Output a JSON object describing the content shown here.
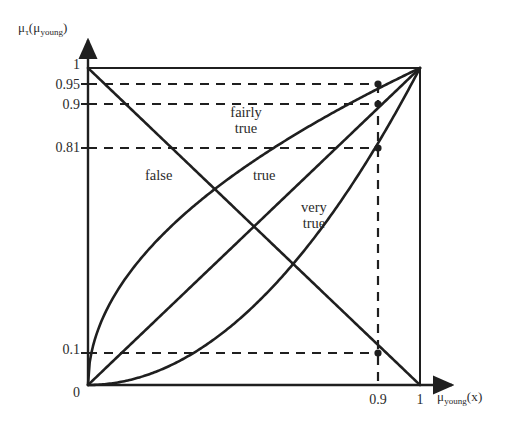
{
  "chart_data": {
    "type": "line",
    "title": "",
    "xlabel": "μ_young(x)",
    "ylabel": "μ_τ(μ_young)",
    "xlim": [
      0,
      1
    ],
    "ylim": [
      0,
      1
    ],
    "grid": false,
    "legend_position": "inline-annotations",
    "x_ticks": [
      "0",
      "0.9",
      "1"
    ],
    "x_tick_values": [
      0,
      0.9,
      1
    ],
    "y_ticks": [
      "0",
      "0.1",
      "0.81",
      "0.9",
      "0.95",
      "1"
    ],
    "y_tick_values": [
      0,
      0.1,
      0.81,
      0.9,
      0.95,
      1
    ],
    "series": [
      {
        "name": "false",
        "formula": "1 - x",
        "x": [
          0,
          0.1,
          0.2,
          0.3,
          0.4,
          0.5,
          0.6,
          0.7,
          0.8,
          0.9,
          1
        ],
        "values": [
          1,
          0.9,
          0.8,
          0.7,
          0.6,
          0.5,
          0.4,
          0.3,
          0.2,
          0.1,
          0
        ]
      },
      {
        "name": "true",
        "formula": "x",
        "x": [
          0,
          0.1,
          0.2,
          0.3,
          0.4,
          0.5,
          0.6,
          0.7,
          0.8,
          0.9,
          1
        ],
        "values": [
          0,
          0.1,
          0.2,
          0.3,
          0.4,
          0.5,
          0.6,
          0.7,
          0.8,
          0.9,
          1
        ]
      },
      {
        "name": "fairly true",
        "formula": "sqrt(x)",
        "x": [
          0,
          0.1,
          0.2,
          0.3,
          0.4,
          0.5,
          0.6,
          0.7,
          0.8,
          0.9,
          1
        ],
        "values": [
          0,
          0.316,
          0.447,
          0.548,
          0.632,
          0.707,
          0.775,
          0.837,
          0.894,
          0.95,
          1
        ]
      },
      {
        "name": "very true",
        "formula": "x^2",
        "x": [
          0,
          0.1,
          0.2,
          0.3,
          0.4,
          0.5,
          0.6,
          0.7,
          0.8,
          0.9,
          1
        ],
        "values": [
          0,
          0.01,
          0.04,
          0.09,
          0.16,
          0.25,
          0.36,
          0.49,
          0.64,
          0.81,
          1
        ]
      }
    ],
    "annotations": [
      {
        "label": "false",
        "x": 0.21,
        "y": 0.655
      },
      {
        "label": "true",
        "x": 0.52,
        "y": 0.655
      },
      {
        "label": "fairly true",
        "x": 0.435,
        "y": 0.84
      },
      {
        "label": "very true",
        "x": 0.645,
        "y": 0.53
      }
    ],
    "reference_lines": [
      {
        "axis": "y",
        "value": 0.95,
        "style": "dashed",
        "marks_series": "fairly true"
      },
      {
        "axis": "y",
        "value": 0.9,
        "style": "dashed",
        "marks_series": "true"
      },
      {
        "axis": "y",
        "value": 0.81,
        "style": "dashed",
        "marks_series": "very true"
      },
      {
        "axis": "y",
        "value": 0.1,
        "style": "dashed",
        "marks_series": "false"
      },
      {
        "axis": "x",
        "value": 0.9,
        "style": "dashed"
      }
    ],
    "markers_at_x_0_9": [
      {
        "series": "fairly true",
        "y": 0.95
      },
      {
        "series": "true",
        "y": 0.9
      },
      {
        "series": "very true",
        "y": 0.81
      },
      {
        "series": "false",
        "y": 0.1
      }
    ],
    "colors": {
      "curve": "#1f1f1f",
      "dashed": "#1f1f1f",
      "axis": "#1f1f1f",
      "text": "#2b2b2b",
      "background": "#ffffff"
    }
  },
  "axes": {
    "y_axis_label_mu": "μ",
    "y_axis_label_tau_sub": "τ",
    "y_axis_label_open": "(",
    "y_axis_label_mu2": "μ",
    "y_axis_label_young_sub": "young",
    "y_axis_label_close": ")",
    "x_axis_label_mu": "μ",
    "x_axis_label_young_sub": "young",
    "x_axis_label_of_x": "(x)"
  },
  "ticks": {
    "y": [
      {
        "text": "1"
      },
      {
        "text": "0.95"
      },
      {
        "text": "0.9"
      },
      {
        "text": "0.81"
      },
      {
        "text": "0.1"
      },
      {
        "text": "0"
      }
    ],
    "x": [
      {
        "text": "0.9"
      },
      {
        "text": "1"
      }
    ]
  },
  "labels": {
    "false": "false",
    "true": "true",
    "fairly": "fairly",
    "fairly_true": "true",
    "very": "very",
    "very_true": "true"
  }
}
